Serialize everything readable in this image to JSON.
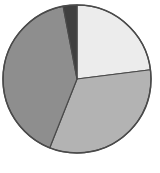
{
  "chart_data": {
    "type": "pie",
    "title": "",
    "center": [
      77,
      79
    ],
    "radius": 74,
    "start_angle_deg": 0,
    "direction": "clockwise",
    "legend": "none",
    "slices": [
      {
        "label": "",
        "value": 23,
        "color": "#ececec"
      },
      {
        "label": "",
        "value": 33,
        "color": "#b3b3b3"
      },
      {
        "label": "",
        "value": 41,
        "color": "#8e8e8e"
      },
      {
        "label": "",
        "value": 3,
        "color": "#3f3f3f"
      }
    ],
    "stroke_color": "#4a4a4a"
  }
}
